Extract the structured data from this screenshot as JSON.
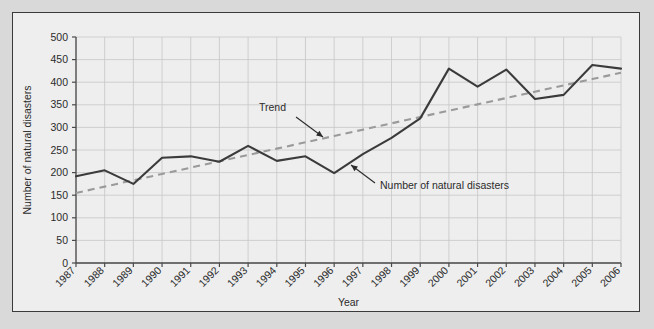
{
  "chart_data": {
    "type": "line",
    "title": "",
    "xlabel": "Year",
    "ylabel": "Number of natural disasters",
    "categories": [
      "1987",
      "1988",
      "1989",
      "1990",
      "1991",
      "1992",
      "1993",
      "1994",
      "1995",
      "1996",
      "1997",
      "1998",
      "1999",
      "2000",
      "2001",
      "2002",
      "2003",
      "2004",
      "2005",
      "2006"
    ],
    "x": [
      1987,
      1988,
      1989,
      1990,
      1991,
      1992,
      1993,
      1994,
      1995,
      1996,
      1997,
      1998,
      1999,
      2000,
      2001,
      2002,
      2003,
      2004,
      2005,
      2006
    ],
    "series": [
      {
        "name": "Number of natural disasters",
        "style": "solid",
        "color": "#3b3b3b",
        "values": [
          192,
          205,
          175,
          233,
          236,
          224,
          259,
          226,
          236,
          199,
          241,
          277,
          320,
          430,
          390,
          428,
          363,
          372,
          438,
          430
        ]
      },
      {
        "name": "Trend",
        "style": "dashed",
        "color": "#9a9a9a",
        "values": [
          155,
          169,
          183,
          197,
          211,
          225,
          239,
          253,
          267,
          281,
          295,
          309,
          323,
          337,
          351,
          365,
          379,
          393,
          407,
          421
        ]
      }
    ],
    "ylim": [
      0,
      500
    ],
    "ytick_values": [
      0,
      50,
      100,
      150,
      200,
      250,
      300,
      350,
      400,
      450,
      500
    ],
    "ytick_labels": [
      "0",
      "50",
      "100",
      "150",
      "200",
      "250",
      "300",
      "350",
      "400",
      "450",
      "500"
    ],
    "grid": true,
    "legend": "none",
    "annotations": [
      {
        "text": "Trend",
        "target_series": "Trend"
      },
      {
        "text": "Number of natural disasters",
        "target_series": "Number of natural disasters"
      }
    ]
  },
  "colors": {
    "page_background": "#d9d9d9",
    "figure_background": "#eeeeee",
    "frame_border": "#3a3a3a",
    "grid": "#c6c6c6",
    "axis": "#4a4a4a",
    "data_line": "#3b3b3b",
    "trend_line": "#9a9a9a",
    "text": "#2b2b2b"
  }
}
